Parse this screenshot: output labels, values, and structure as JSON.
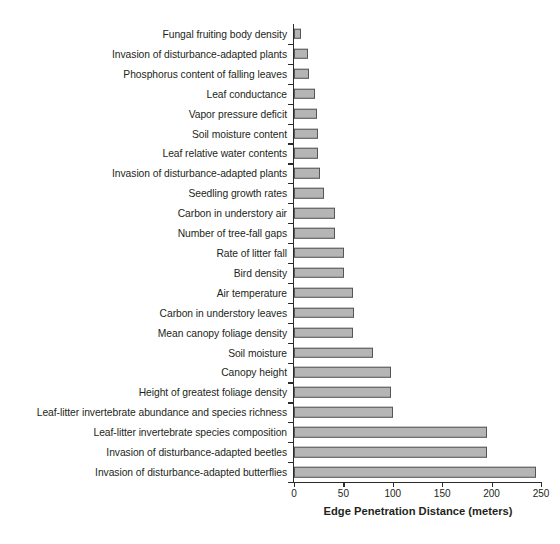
{
  "chart_data": {
    "type": "bar",
    "orientation": "horizontal",
    "title": "",
    "xlabel": "Edge Penetration Distance (meters)",
    "ylabel": "",
    "xlim": [
      0,
      250
    ],
    "xticks": [
      0,
      50,
      100,
      150,
      200,
      250
    ],
    "xtick_labels": [
      "0",
      "50",
      "100",
      "150",
      "200",
      "250"
    ],
    "grid": false,
    "legend": false,
    "bar_fill_color": "#b5b5b5",
    "bar_edge_color": "#555555",
    "axis_color": "#2b2b2b",
    "categories": [
      "Fungal fruiting body density",
      "Invasion of disturbance-adapted plants",
      "Phosphorus content of falling leaves",
      "Leaf conductance",
      "Vapor pressure deficit",
      "Soil moisture content",
      "Leaf relative water contents",
      "Invasion of disturbance-adapted plants",
      "Seedling growth rates",
      "Carbon in understory air",
      "Number of tree-fall gaps",
      "Rate of litter fall",
      "Bird density",
      "Air temperature",
      "Carbon in understory leaves",
      "Mean canopy foliage density",
      "Soil moisture",
      "Canopy height",
      "Height of greatest foliage density",
      "Leaf-litter invertebrate abundance and species richness",
      "Leaf-litter invertebrate species composition",
      "Invasion of disturbance-adapted beetles",
      "Invasion of disturbance-adapted butterflies"
    ],
    "values": [
      7,
      14,
      15,
      21,
      23,
      24,
      24,
      26,
      30,
      42,
      42,
      51,
      51,
      60,
      61,
      60,
      80,
      98,
      98,
      100,
      195,
      195,
      245
    ]
  }
}
